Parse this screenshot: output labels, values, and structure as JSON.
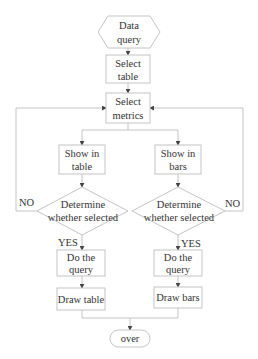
{
  "diagram": {
    "type": "flowchart",
    "colors": {
      "line": "#c4c4c4",
      "text": "#333333",
      "arrow": "#444444",
      "background": "#ffffff"
    },
    "nodes": {
      "start": {
        "shape": "hexagon",
        "line1": "Data",
        "line2": "query"
      },
      "select_table": {
        "shape": "rectangle",
        "line1": "Select",
        "line2": "table"
      },
      "select_metrics": {
        "shape": "rectangle",
        "line1": "Select",
        "line2": "metrics"
      },
      "show_table": {
        "shape": "rectangle",
        "line1": "Show in",
        "line2": "table"
      },
      "show_bars": {
        "shape": "rectangle",
        "line1": "Show in",
        "line2": "bars"
      },
      "decide_left": {
        "shape": "diamond",
        "line1": "Determine",
        "line2": "whether selected"
      },
      "decide_right": {
        "shape": "diamond",
        "line1": "Determine",
        "line2": "whether selected"
      },
      "query_left": {
        "shape": "rectangle",
        "line1": "Do the",
        "line2": "query"
      },
      "query_right": {
        "shape": "rectangle",
        "line1": "Do the",
        "line2": "query"
      },
      "draw_table": {
        "shape": "rectangle",
        "line1": "Draw table"
      },
      "draw_bars": {
        "shape": "rectangle",
        "line1": "Draw bars"
      },
      "end": {
        "shape": "terminal",
        "line1": "over"
      }
    },
    "edge_labels": {
      "left_no": "NO",
      "right_no": "NO",
      "left_yes": "YES",
      "right_yes": "YES"
    },
    "edges": [
      {
        "from": "start",
        "to": "select_table"
      },
      {
        "from": "select_table",
        "to": "select_metrics"
      },
      {
        "from": "select_metrics",
        "to": "show_table"
      },
      {
        "from": "select_metrics",
        "to": "show_bars"
      },
      {
        "from": "show_table",
        "to": "decide_left"
      },
      {
        "from": "show_bars",
        "to": "decide_right"
      },
      {
        "from": "decide_left",
        "to": "select_metrics",
        "label": "NO"
      },
      {
        "from": "decide_right",
        "to": "select_metrics",
        "label": "NO"
      },
      {
        "from": "decide_left",
        "to": "query_left",
        "label": "YES"
      },
      {
        "from": "decide_right",
        "to": "query_right",
        "label": "YES"
      },
      {
        "from": "query_left",
        "to": "draw_table"
      },
      {
        "from": "query_right",
        "to": "draw_bars"
      },
      {
        "from": "draw_table",
        "to": "end"
      },
      {
        "from": "draw_bars",
        "to": "end"
      }
    ]
  }
}
